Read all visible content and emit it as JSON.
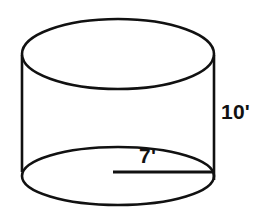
{
  "figure": {
    "name": "cylinder-diagram",
    "shape": "cylinder",
    "background_color": "#ffffff",
    "stroke_color": "#111111"
  },
  "labels": {
    "height": "10'",
    "radius": "7'"
  },
  "chart_data": {
    "type": "diagram",
    "title": "",
    "subtitle": "",
    "xlabel": "",
    "ylabel": "",
    "shape": "cylinder",
    "annotations": [
      {
        "name": "height-label",
        "text": "10'",
        "value": 10,
        "unit": "feet",
        "measures": "height",
        "position": "right side, outside the cylinder"
      },
      {
        "name": "radius-label",
        "text": "7'",
        "value": 7,
        "unit": "feet",
        "measures": "radius",
        "position": "above the radius segment on the bottom ellipse"
      }
    ],
    "geometry": {
      "top_ellipse": {
        "cx": 118,
        "cy": 54,
        "rx": 96,
        "ry": 35
      },
      "bottom_ellipse": {
        "cx": 118,
        "cy": 176,
        "rx": 96,
        "ry": 29
      },
      "left_edge": {
        "x": 22,
        "y1": 55,
        "y2": 172
      },
      "right_edge": {
        "x": 214,
        "y1": 55,
        "y2": 180
      },
      "radius_segment": {
        "x1": 113,
        "y1": 172,
        "x2": 214,
        "y2": 172
      }
    }
  }
}
